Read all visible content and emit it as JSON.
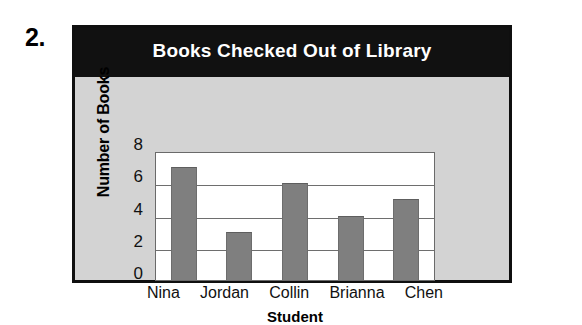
{
  "problem": {
    "number": "2."
  },
  "chart_data": {
    "type": "bar",
    "title": "Books Checked Out of Library",
    "xlabel": "Student",
    "ylabel": "Number of Books",
    "categories": [
      "Nina",
      "Jordan",
      "Collin",
      "Brianna",
      "Chen"
    ],
    "values": [
      7,
      3,
      6,
      4,
      5
    ],
    "ylim": [
      0,
      8
    ],
    "yticks": [
      8,
      6,
      4,
      2,
      0
    ],
    "grid": true,
    "legend": "none",
    "colors": {
      "bar": "#7f7f7f",
      "title_bar_background": "#111111",
      "title_text": "#ffffff",
      "figure_background": "#d3d3d3",
      "plot_background": "#ffffff",
      "frame_border": "#0f0f0f",
      "gridline": "#6e6e6e"
    }
  }
}
